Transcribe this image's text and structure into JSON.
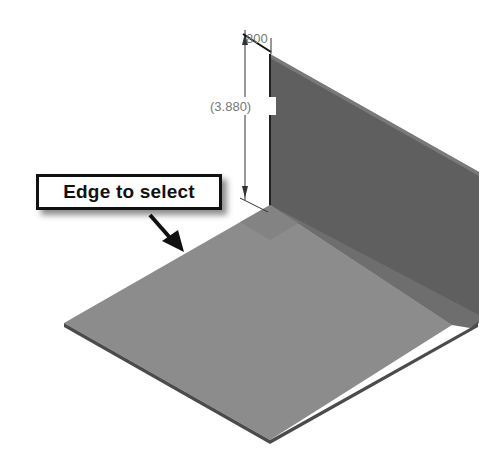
{
  "diagram": {
    "callout": {
      "label": "Edge to select"
    },
    "dimensions": {
      "thickness": "800",
      "height": "(3.880)"
    },
    "colors": {
      "flange_face": "#5e5e5e",
      "base_face": "#8c8c8c",
      "edge": "#4a4a4a",
      "dimension_line": "#222222",
      "dimension_text": "#777777",
      "callout_border": "#111111"
    }
  }
}
